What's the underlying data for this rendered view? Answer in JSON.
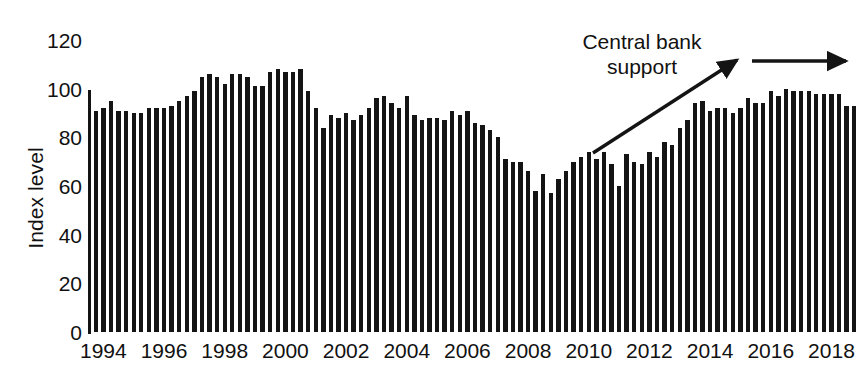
{
  "chart_data": {
    "type": "bar",
    "title": "",
    "subtitle": "",
    "xlabel": "",
    "ylabel": "Index level",
    "ylim": [
      0,
      120
    ],
    "yticks": [
      0,
      20,
      40,
      60,
      80,
      100,
      120
    ],
    "ytick_labels": [
      "0",
      "20",
      "40",
      "60",
      "80",
      "100",
      "120"
    ],
    "xlim": [
      1994.0,
      2019.25
    ],
    "xticks": [
      1994,
      1996,
      1998,
      2000,
      2002,
      2004,
      2006,
      2008,
      2010,
      2012,
      2014,
      2016,
      2018
    ],
    "xtick_labels": [
      "1994",
      "1996",
      "1998",
      "2000",
      "2002",
      "2004",
      "2006",
      "2008",
      "2010",
      "2012",
      "2014",
      "2016",
      "2018"
    ],
    "grid": false,
    "legend": false,
    "frequency": "quarterly",
    "bar_color": "#141414",
    "categories": [
      "1994 Q1",
      "1994 Q2",
      "1994 Q3",
      "1994 Q4",
      "1995 Q1",
      "1995 Q2",
      "1995 Q3",
      "1995 Q4",
      "1996 Q1",
      "1996 Q2",
      "1996 Q3",
      "1996 Q4",
      "1997 Q1",
      "1997 Q2",
      "1997 Q3",
      "1997 Q4",
      "1998 Q1",
      "1998 Q2",
      "1998 Q3",
      "1998 Q4",
      "1999 Q1",
      "1999 Q2",
      "1999 Q3",
      "1999 Q4",
      "2000 Q1",
      "2000 Q2",
      "2000 Q3",
      "2000 Q4",
      "2001 Q1",
      "2001 Q2",
      "2001 Q3",
      "2001 Q4",
      "2002 Q1",
      "2002 Q2",
      "2002 Q3",
      "2002 Q4",
      "2003 Q1",
      "2003 Q2",
      "2003 Q3",
      "2003 Q4",
      "2004 Q1",
      "2004 Q2",
      "2004 Q3",
      "2004 Q4",
      "2005 Q1",
      "2005 Q2",
      "2005 Q3",
      "2005 Q4",
      "2006 Q1",
      "2006 Q2",
      "2006 Q3",
      "2006 Q4",
      "2007 Q1",
      "2007 Q2",
      "2007 Q3",
      "2007 Q4",
      "2008 Q1",
      "2008 Q2",
      "2008 Q3",
      "2008 Q4",
      "2009 Q1",
      "2009 Q2",
      "2009 Q3",
      "2009 Q4",
      "2010 Q1",
      "2010 Q2",
      "2010 Q3",
      "2010 Q4",
      "2011 Q1",
      "2011 Q2",
      "2011 Q3",
      "2011 Q4",
      "2012 Q1",
      "2012 Q2",
      "2012 Q3",
      "2012 Q4",
      "2013 Q1",
      "2013 Q2",
      "2013 Q3",
      "2013 Q4",
      "2014 Q1",
      "2014 Q2",
      "2014 Q3",
      "2014 Q4",
      "2015 Q1",
      "2015 Q2",
      "2015 Q3",
      "2015 Q4",
      "2016 Q1",
      "2016 Q2",
      "2016 Q3",
      "2016 Q4",
      "2017 Q1",
      "2017 Q2",
      "2017 Q3",
      "2017 Q4",
      "2018 Q1",
      "2018 Q2",
      "2018 Q3",
      "2018 Q4",
      "2019 Q1"
    ],
    "values": [
      91,
      92,
      95,
      91,
      91,
      90,
      90,
      92,
      92,
      92,
      93,
      95,
      97,
      99,
      105,
      106,
      105,
      102,
      106,
      106,
      105,
      101,
      101,
      107,
      108,
      107,
      107,
      108,
      99,
      92,
      84,
      89,
      88,
      90,
      87,
      89,
      92,
      96,
      97,
      94,
      92,
      97,
      89,
      87,
      88,
      88,
      87,
      91,
      89,
      91,
      86,
      85,
      83,
      80,
      71,
      70,
      70,
      66,
      58,
      65,
      57,
      63,
      66,
      70,
      72,
      74,
      71,
      74,
      69,
      60,
      73,
      70,
      69,
      74,
      72,
      78,
      77,
      84,
      87,
      94,
      95,
      91,
      92,
      92,
      90,
      92,
      96,
      94,
      94,
      99,
      97,
      100,
      99,
      99,
      99,
      98,
      98,
      98,
      98,
      93,
      93
    ]
  },
  "annotation": {
    "label": "Central bank\nsupport",
    "rising_arrow": {
      "from": [
        593,
        153
      ],
      "to": [
        737,
        60
      ]
    },
    "flat_arrow": {
      "from": [
        752,
        61
      ],
      "to": [
        846,
        61
      ]
    }
  },
  "axes": {
    "y_axis_color": "#141414",
    "text_color": "#111111"
  }
}
